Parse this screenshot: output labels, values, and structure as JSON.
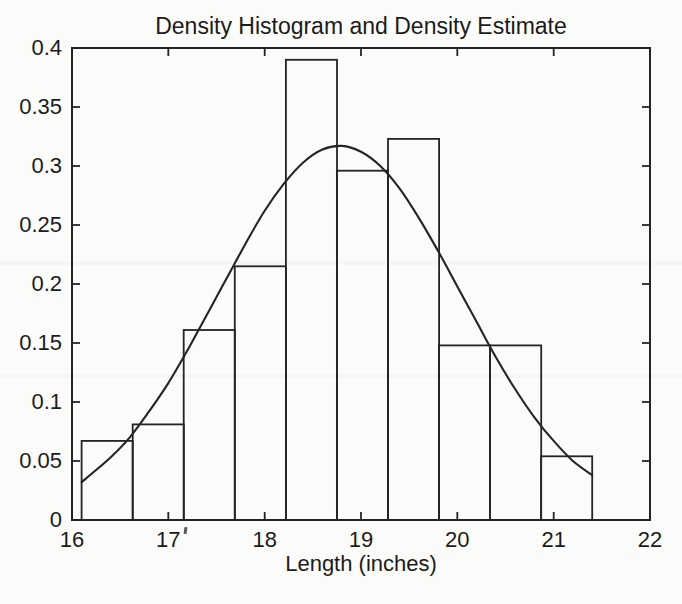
{
  "figure": {
    "background_color": "#fbfbf9",
    "ink_color": "#242424"
  },
  "chart_data": {
    "type": "bar",
    "subtype": "density-histogram-with-density-curve",
    "title": "Density Histogram and Density Estimate",
    "xlabel": "Length (inches)",
    "ylabel": "",
    "xlim": [
      16,
      22
    ],
    "ylim": [
      0,
      0.4
    ],
    "grid": false,
    "legend": "none",
    "x_ticks": [
      16,
      17,
      18,
      19,
      20,
      21,
      22
    ],
    "x_tick_labels": [
      "16",
      "17",
      "18",
      "19",
      "20",
      "21",
      "22"
    ],
    "y_ticks": [
      0,
      0.05,
      0.1,
      0.15,
      0.2,
      0.25,
      0.3,
      0.35,
      0.4
    ],
    "y_tick_labels": [
      "0",
      "0.05",
      "0.1",
      "0.15",
      "0.2",
      "0.25",
      "0.3",
      "0.35",
      "0.4"
    ],
    "histogram": {
      "bin_edges": [
        16.1,
        16.63,
        17.16,
        17.69,
        18.22,
        18.75,
        19.28,
        19.81,
        20.34,
        20.87,
        21.4
      ],
      "densities": [
        0.067,
        0.081,
        0.161,
        0.215,
        0.39,
        0.296,
        0.323,
        0.148,
        0.148,
        0.054
      ]
    },
    "density_curve": {
      "x": [
        16.1,
        16.2,
        16.4,
        16.6,
        16.8,
        17.0,
        17.2,
        17.4,
        17.6,
        17.8,
        18.0,
        18.2,
        18.4,
        18.6,
        18.8,
        19.0,
        19.2,
        19.4,
        19.6,
        19.8,
        20.0,
        20.2,
        20.4,
        20.6,
        20.8,
        21.0,
        21.2,
        21.4
      ],
      "y": [
        0.032,
        0.039,
        0.053,
        0.07,
        0.092,
        0.116,
        0.144,
        0.174,
        0.204,
        0.234,
        0.262,
        0.285,
        0.303,
        0.314,
        0.317,
        0.312,
        0.3,
        0.281,
        0.256,
        0.228,
        0.198,
        0.168,
        0.138,
        0.111,
        0.087,
        0.067,
        0.05,
        0.038
      ],
      "peak": {
        "x": 18.8,
        "y": 0.317
      }
    }
  }
}
